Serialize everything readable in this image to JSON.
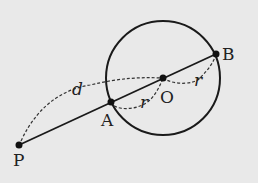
{
  "diagram": {
    "points": {
      "P": "P",
      "A": "A",
      "O": "O",
      "B": "B"
    },
    "labels": {
      "d": "d",
      "r1": "r",
      "r2": "r"
    },
    "colors": {
      "background": "#e9e9e9",
      "stroke": "#1a1a1a"
    }
  }
}
